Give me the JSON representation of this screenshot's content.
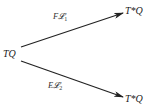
{
  "diagram": {
    "type": "commutative-diagram",
    "nodes": [
      {
        "id": "source",
        "label": "TQ"
      },
      {
        "id": "target_top",
        "label": "T*Q"
      },
      {
        "id": "target_bottom",
        "label": "T*Q"
      }
    ],
    "edges": [
      {
        "from": "source",
        "to": "target_top",
        "label_main": "F𝓛",
        "label_sub": "1"
      },
      {
        "from": "source",
        "to": "target_bottom",
        "label_main": "E𝓛",
        "label_sub": "2"
      }
    ],
    "colors": {
      "background": "#ffffff",
      "stroke": "#222222",
      "text": "#1a1a1a"
    }
  }
}
